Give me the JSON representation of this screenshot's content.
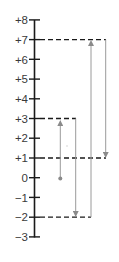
{
  "diagram": {
    "type": "number-line",
    "axis": {
      "min": -3,
      "max": 8,
      "ticks": [
        {
          "value": 8,
          "label": "+8"
        },
        {
          "value": 7,
          "label": "+7"
        },
        {
          "value": 6,
          "label": "+6"
        },
        {
          "value": 5,
          "label": "+5"
        },
        {
          "value": 4,
          "label": "+4"
        },
        {
          "value": 3,
          "label": "+3"
        },
        {
          "value": 2,
          "label": "+2"
        },
        {
          "value": 1,
          "label": "+1"
        },
        {
          "value": 0,
          "label": "0"
        },
        {
          "value": -1,
          "label": "−1"
        },
        {
          "value": -2,
          "label": "−2"
        },
        {
          "value": -3,
          "label": "−3"
        }
      ]
    },
    "start_point": {
      "value": 0
    },
    "moves": [
      {
        "from": 0,
        "to": 3,
        "direction": "up"
      },
      {
        "from": 3,
        "to": -2,
        "direction": "down"
      },
      {
        "from": -2,
        "to": 7,
        "direction": "up"
      },
      {
        "from": 7,
        "to": 1,
        "direction": "down"
      }
    ],
    "dashed_guides": [
      7,
      3,
      1,
      -2
    ],
    "colors": {
      "axis": "#1a1a1a",
      "dashes": "#1a1a1a",
      "arrows": "#9a9a9a",
      "labels": "#3a3a3a"
    }
  }
}
